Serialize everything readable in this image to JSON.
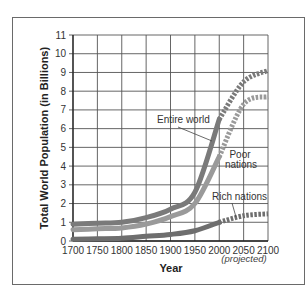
{
  "chart_data": {
    "type": "line",
    "title": "",
    "xlabel": "Year",
    "xlabel_note": "(projected)",
    "ylabel": "Total World Population (in Billions)",
    "xlim": [
      1700,
      2100
    ],
    "ylim": [
      0,
      11
    ],
    "grid": true,
    "x_ticks": [
      "1700",
      "1750",
      "1800",
      "1850",
      "1900",
      "1950",
      "2000",
      "2050",
      "2100"
    ],
    "y_ticks": [
      "0",
      "1",
      "2",
      "3",
      "4",
      "5",
      "6",
      "7",
      "8",
      "9",
      "10",
      "11"
    ],
    "x": [
      1700,
      1750,
      1800,
      1850,
      1900,
      1950,
      2000,
      2050,
      2100
    ],
    "projected_from": 2000,
    "series": [
      {
        "name": "Entire world",
        "color": "#7a7a7a",
        "values": [
          0.9,
          0.95,
          1.0,
          1.25,
          1.7,
          2.6,
          6.5,
          8.5,
          9.1
        ]
      },
      {
        "name": "Poor nations",
        "color": "#9a9a9a",
        "values": [
          0.6,
          0.65,
          0.7,
          0.9,
          1.3,
          2.0,
          4.5,
          7.3,
          7.7
        ]
      },
      {
        "name": "Rich nations",
        "color": "#6e6e6e",
        "values": [
          0.1,
          0.12,
          0.15,
          0.25,
          0.35,
          0.55,
          1.0,
          1.35,
          1.45
        ]
      }
    ],
    "annotations": [
      {
        "text": "Entire world"
      },
      {
        "text": "Poor nations"
      },
      {
        "text": "Rich nations"
      }
    ]
  }
}
